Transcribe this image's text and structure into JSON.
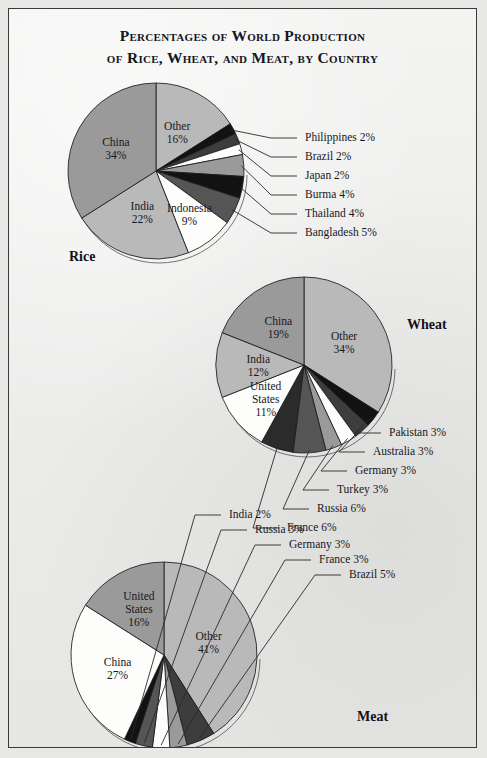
{
  "figure": {
    "title_line1": "Percentages of World Production",
    "title_line2": "of Rice, Wheat, and Meat, by Country",
    "background_color": "#ececeb",
    "border_color": "#3a3a3a"
  },
  "palette": {
    "light_gray": "#b9b9b9",
    "mid_gray": "#9a9a9a",
    "gray": "#7e7e7e",
    "dark_gray": "#555555",
    "darker_gray": "#3d3d3d",
    "black": "#121212",
    "white": "#fdfdfb"
  },
  "chart_data": [
    {
      "type": "pie",
      "title": "Rice",
      "name_label": "Rice",
      "unit": "%",
      "total": 100,
      "start_angle_deg": 0,
      "direction": "clockwise",
      "center": [
        147,
        162
      ],
      "radius": 88,
      "categories": [
        "Other",
        "Philippines",
        "Brazil",
        "Japan",
        "Burma",
        "Thailand",
        "Bangladesh",
        "Indonesia",
        "India",
        "China"
      ],
      "values": [
        16,
        2,
        2,
        2,
        4,
        4,
        5,
        9,
        22,
        34
      ],
      "colors": [
        "#b9b9b9",
        "#121212",
        "#3d3d3d",
        "#fdfdfb",
        "#9a9a9a",
        "#121212",
        "#555555",
        "#fdfdfb",
        "#b9b9b9",
        "#9a9a9a"
      ],
      "inside_labels": [
        {
          "name": "Other",
          "line1": "Other",
          "line2": "16%"
        },
        {
          "name": "China",
          "line1": "China",
          "line2": "34%"
        },
        {
          "name": "India",
          "line1": "India",
          "line2": "22%"
        },
        {
          "name": "Indonesia",
          "line1": "Indonesia",
          "line2": "9%"
        }
      ],
      "leader_labels": [
        {
          "name": "Philippines",
          "text": "Philippines 2%"
        },
        {
          "name": "Brazil",
          "text": "Brazil 2%"
        },
        {
          "name": "Japan",
          "text": "Japan 2%"
        },
        {
          "name": "Burma",
          "text": "Burma 4%"
        },
        {
          "name": "Thailand",
          "text": "Thailand 4%"
        },
        {
          "name": "Bangladesh",
          "text": "Bangladesh 5%"
        }
      ]
    },
    {
      "type": "pie",
      "title": "Wheat",
      "name_label": "Wheat",
      "unit": "%",
      "total": 100,
      "start_angle_deg": 0,
      "direction": "clockwise",
      "center": [
        295,
        356
      ],
      "radius": 88,
      "categories": [
        "Other",
        "Pakistan",
        "Australia",
        "Germany",
        "Turkey",
        "Russia",
        "France",
        "United States",
        "India",
        "China"
      ],
      "values": [
        34,
        3,
        3,
        3,
        3,
        6,
        6,
        11,
        12,
        19
      ],
      "colors": [
        "#b9b9b9",
        "#121212",
        "#3d3d3d",
        "#fdfdfb",
        "#9a9a9a",
        "#555555",
        "#2b2b2b",
        "#fdfdfb",
        "#b9b9b9",
        "#9a9a9a"
      ],
      "inside_labels": [
        {
          "name": "Other",
          "line1": "Other",
          "line2": "34%"
        },
        {
          "name": "China",
          "line1": "China",
          "line2": "19%"
        },
        {
          "name": "India",
          "line1": "India",
          "line2": "12%"
        },
        {
          "name": "United States",
          "line1": "United",
          "line2": "States",
          "line3": "11%"
        }
      ],
      "leader_labels": [
        {
          "name": "Pakistan",
          "text": "Pakistan 3%"
        },
        {
          "name": "Australia",
          "text": "Australia 3%"
        },
        {
          "name": "Germany",
          "text": "Germany 3%"
        },
        {
          "name": "Turkey",
          "text": "Turkey 3%"
        },
        {
          "name": "Russia",
          "text": "Russia 6%"
        },
        {
          "name": "France",
          "text": "France 6%"
        }
      ]
    },
    {
      "type": "pie",
      "title": "Meat",
      "name_label": "Meat",
      "unit": "%",
      "total": 100,
      "start_angle_deg": 0,
      "direction": "clockwise",
      "center": [
        155,
        646
      ],
      "radius": 93,
      "categories": [
        "Other",
        "Brazil",
        "France",
        "Germany",
        "Russia",
        "India",
        "China",
        "United States"
      ],
      "values": [
        41,
        5,
        3,
        3,
        3,
        2,
        27,
        16
      ],
      "colors": [
        "#b9b9b9",
        "#3d3d3d",
        "#9a9a9a",
        "#fdfdfb",
        "#555555",
        "#121212",
        "#fdfdfb",
        "#9a9a9a"
      ],
      "inside_labels": [
        {
          "name": "Other",
          "line1": "Other",
          "line2": "41%"
        },
        {
          "name": "China",
          "line1": "China",
          "line2": "27%"
        },
        {
          "name": "United States",
          "line1": "United",
          "line2": "States",
          "line3": "16%"
        }
      ],
      "leader_labels": [
        {
          "name": "India",
          "text": "India 2%"
        },
        {
          "name": "Russia",
          "text": "Russia 3%"
        },
        {
          "name": "Germany",
          "text": "Germany 3%"
        },
        {
          "name": "France",
          "text": "France 3%"
        },
        {
          "name": "Brazil",
          "text": "Brazil 5%"
        }
      ]
    }
  ]
}
